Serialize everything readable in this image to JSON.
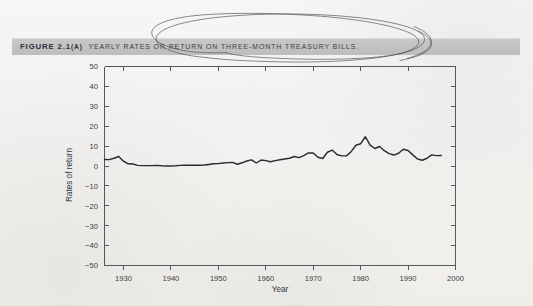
{
  "figure": {
    "banner_color": "#c2c2c2",
    "caption_number": "FIGURE 2.1",
    "caption_part": "(A)",
    "caption_title": "YEARLY RATES OR RETURN ON THREE-MONTH TREASURY BILLS.",
    "annotation": {
      "name": "hand-drawn-ellipse",
      "description": "double-looped oval scribble circling part of the caption"
    }
  },
  "chart_data": {
    "type": "line",
    "title": "YEARLY RATES OR RETURN ON THREE-MONTH TREASURY BILLS.",
    "xlabel": "Year",
    "ylabel": "Rates of return",
    "xlim": [
      1926,
      2000
    ],
    "ylim": [
      -50,
      50
    ],
    "xticks": [
      1930,
      1940,
      1950,
      1960,
      1970,
      1980,
      1990,
      2000
    ],
    "yticks": [
      50,
      40,
      30,
      20,
      10,
      0,
      -10,
      -20,
      -30,
      -40,
      -50
    ],
    "grid": false,
    "legend": null,
    "series": [
      {
        "name": "Three-month Treasury bills",
        "color": "#2b2b2e",
        "x": [
          1926,
          1927,
          1928,
          1929,
          1930,
          1931,
          1932,
          1933,
          1934,
          1935,
          1936,
          1937,
          1938,
          1939,
          1940,
          1941,
          1942,
          1943,
          1944,
          1945,
          1946,
          1947,
          1948,
          1949,
          1950,
          1951,
          1952,
          1953,
          1954,
          1955,
          1956,
          1957,
          1958,
          1959,
          1960,
          1961,
          1962,
          1963,
          1964,
          1965,
          1966,
          1967,
          1968,
          1969,
          1970,
          1971,
          1972,
          1973,
          1974,
          1975,
          1976,
          1977,
          1978,
          1979,
          1980,
          1981,
          1982,
          1983,
          1984,
          1985,
          1986,
          1987,
          1988,
          1989,
          1990,
          1991,
          1992,
          1993,
          1994,
          1995,
          1996,
          1997
        ],
        "values": [
          3.3,
          3.2,
          3.9,
          4.8,
          2.4,
          1.1,
          1.0,
          0.3,
          0.2,
          0.2,
          0.2,
          0.3,
          0.1,
          0.0,
          0.0,
          0.1,
          0.3,
          0.4,
          0.4,
          0.4,
          0.4,
          0.5,
          0.8,
          1.1,
          1.2,
          1.5,
          1.7,
          1.8,
          0.9,
          1.6,
          2.5,
          3.1,
          1.5,
          3.0,
          2.7,
          2.1,
          2.7,
          3.1,
          3.5,
          3.9,
          4.8,
          4.2,
          5.2,
          6.6,
          6.5,
          4.4,
          3.8,
          6.9,
          8.0,
          5.8,
          5.1,
          5.1,
          7.2,
          10.4,
          11.2,
          14.7,
          10.5,
          8.8,
          9.8,
          7.7,
          6.2,
          5.5,
          6.4,
          8.4,
          7.8,
          5.6,
          3.5,
          2.9,
          3.9,
          5.6,
          5.2,
          5.3
        ]
      }
    ]
  }
}
